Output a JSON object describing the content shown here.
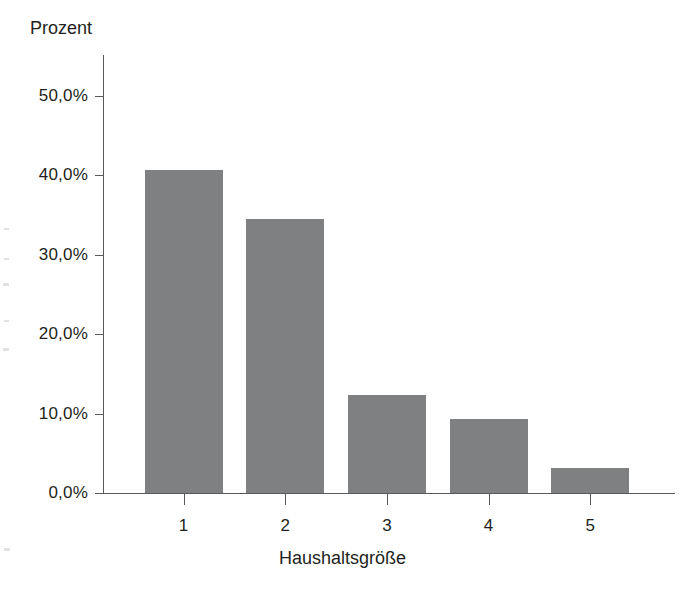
{
  "chart_data": {
    "type": "bar",
    "title": "",
    "xlabel": "Haushaltsgröße",
    "ylabel": "Prozent",
    "categories": [
      "1",
      "2",
      "3",
      "4",
      "5"
    ],
    "values": [
      40.7,
      34.5,
      12.4,
      9.3,
      3.1
    ],
    "value_labels": [
      "40,7%",
      "34,5%",
      "12,4%",
      "9,3%",
      "3,1%"
    ],
    "ytick_values": [
      0,
      10,
      20,
      30,
      40,
      50
    ],
    "ytick_labels": [
      "0,0%",
      "10,0%",
      "20,0%",
      "30,0%",
      "40,0%",
      "50,0%"
    ],
    "ylim": [
      0,
      55.2
    ],
    "xtick_labels": [
      "1",
      "2",
      "3",
      "4",
      "5"
    ],
    "grid": false,
    "legend": false,
    "legend_position": "none",
    "bar_color": "#7f8082",
    "axis_color": "#58595b",
    "text_color": "#231f20",
    "background_color": "#ffffff"
  },
  "axis": {
    "y_title": "Prozent",
    "x_title": "Haushaltsgröße"
  }
}
